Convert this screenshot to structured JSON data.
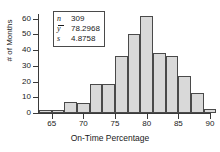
{
  "chart_data": {
    "type": "bar",
    "title": "",
    "xlabel": "On-Time Percentage",
    "ylabel": "# of Months",
    "xlim": [
      63,
      90
    ],
    "ylim": [
      0,
      63
    ],
    "grid": false,
    "bin_width": 2,
    "bin_starts": [
      63,
      65,
      67,
      69,
      71,
      73,
      75,
      77,
      79,
      81,
      83,
      85,
      87,
      89
    ],
    "categories": [
      "63-65",
      "65-67",
      "67-69",
      "69-71",
      "71-73",
      "73-75",
      "75-77",
      "77-79",
      "79-81",
      "81-83",
      "83-85",
      "85-87",
      "87-89",
      "89-91"
    ],
    "values": [
      2,
      2,
      7,
      6.5,
      18.5,
      18.5,
      36.5,
      50.5,
      61.5,
      38,
      36,
      23.5,
      12.5,
      2.5
    ],
    "xticks": [
      65,
      70,
      75,
      80,
      85,
      90
    ],
    "xtick_labels": [
      "65",
      "70",
      "75",
      "80",
      "85",
      "90"
    ],
    "yticks": [
      0,
      10,
      20,
      30,
      40,
      50,
      60
    ],
    "ytick_labels": [
      "0",
      "10",
      "20",
      "30",
      "40",
      "50",
      "60"
    ],
    "bar_fill": "#d9d9d9",
    "bar_stroke": "#4a4a4a",
    "legend_position": "upper-left"
  },
  "stats": {
    "rows": [
      {
        "symbol": "n",
        "value": "309",
        "overline": false
      },
      {
        "symbol": "y",
        "value": "78.2968",
        "overline": true
      },
      {
        "symbol": "s",
        "value": "4.8758",
        "overline": false
      }
    ]
  }
}
